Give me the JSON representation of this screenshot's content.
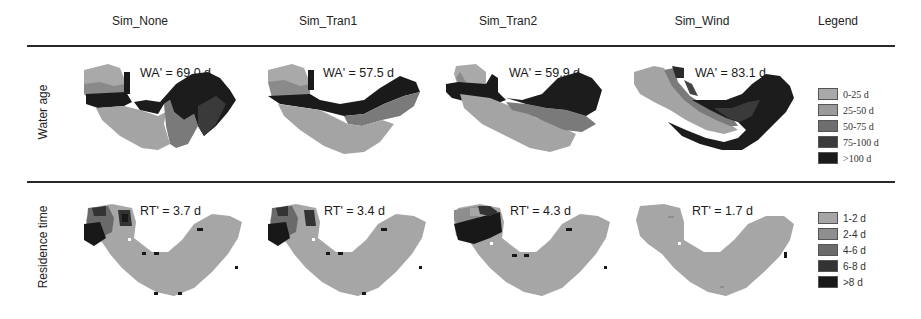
{
  "figure": {
    "columns": [
      "Sim_None",
      "Sim_Tran1",
      "Sim_Tran2",
      "Sim_Wind",
      "Legend"
    ],
    "rows": [
      "Water age",
      "Residence time"
    ],
    "water_age": {
      "panels": [
        {
          "scenario": "Sim_None",
          "label": "WA' = 69.0 d"
        },
        {
          "scenario": "Sim_Tran1",
          "label": "WA' = 57.5 d"
        },
        {
          "scenario": "Sim_Tran2",
          "label": "WA' = 59.9 d"
        },
        {
          "scenario": "Sim_Wind",
          "label": "WA' = 83.1 d"
        }
      ],
      "legend": [
        {
          "label": "0-25 d",
          "color": "#a9a9a9"
        },
        {
          "label": "25-50 d",
          "color": "#9a9a9a"
        },
        {
          "label": "50-75 d",
          "color": "#6e6e6e"
        },
        {
          "label": "75-100 d",
          "color": "#3a3a3a"
        },
        {
          "label": ">100 d",
          "color": "#1a1a1a"
        }
      ]
    },
    "residence_time": {
      "panels": [
        {
          "scenario": "Sim_None",
          "label": "RT' = 3.7 d"
        },
        {
          "scenario": "Sim_Tran1",
          "label": "RT' = 3.4 d"
        },
        {
          "scenario": "Sim_Tran2",
          "label": "RT' = 4.3 d"
        },
        {
          "scenario": "Sim_Wind",
          "label": "RT' = 1.7 d"
        }
      ],
      "legend": [
        {
          "label": "1-2 d",
          "color": "#a6a6a6"
        },
        {
          "label": "2-4 d",
          "color": "#8e8e8e"
        },
        {
          "label": "4-6 d",
          "color": "#6a6a6a"
        },
        {
          "label": "6-8 d",
          "color": "#333333"
        },
        {
          "label": ">8 d",
          "color": "#181818"
        }
      ]
    }
  }
}
